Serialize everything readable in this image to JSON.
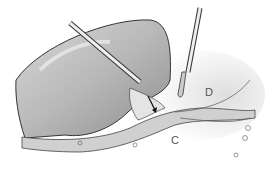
{
  "figure": {
    "type": "surgical-illustration",
    "labels": [
      {
        "id": "D",
        "text": "D"
      },
      {
        "id": "C",
        "text": "C"
      }
    ],
    "instruments": [
      "retractor",
      "electrocautery"
    ],
    "annotations": [
      "arrow"
    ]
  }
}
